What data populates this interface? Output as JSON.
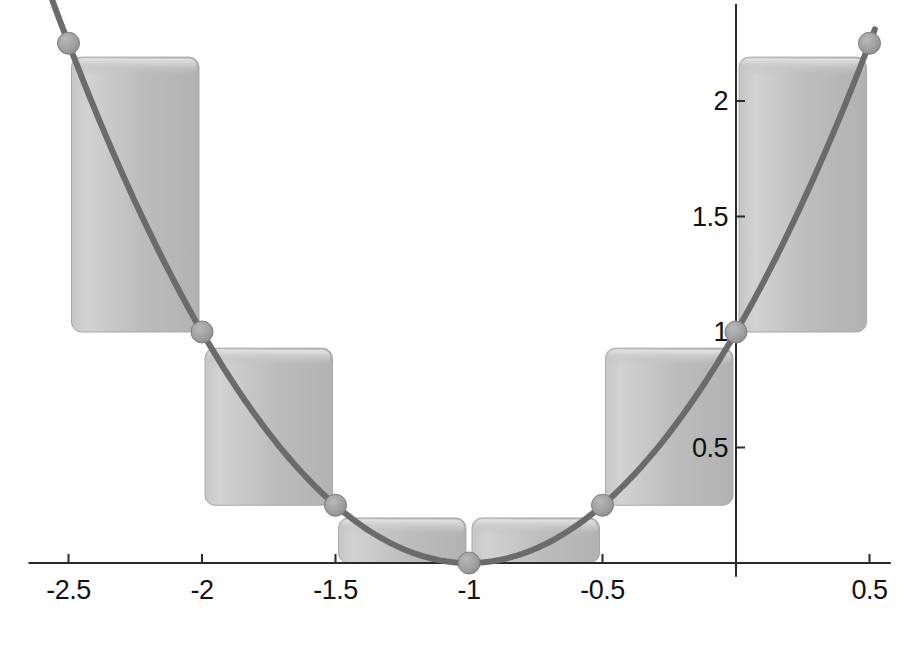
{
  "chart_data": {
    "type": "bar",
    "title": "",
    "subtitle": "",
    "xlabel": "",
    "ylabel": "",
    "xlim": [
      -2.65,
      0.58
    ],
    "ylim": [
      -0.06,
      2.42
    ],
    "grid": false,
    "legend": null,
    "x_ticks": [
      {
        "value": -2.5,
        "label": "-2.5"
      },
      {
        "value": -2,
        "label": "-2"
      },
      {
        "value": -1.5,
        "label": "-1.5"
      },
      {
        "value": -1,
        "label": "-1"
      },
      {
        "value": -0.5,
        "label": "-0.5"
      },
      {
        "value": 0.5,
        "label": "0.5"
      }
    ],
    "y_ticks": [
      {
        "value": 0.5,
        "label": "0.5"
      },
      {
        "value": 1,
        "label": "1"
      },
      {
        "value": 1.5,
        "label": "1.5"
      },
      {
        "value": 2,
        "label": "2"
      }
    ],
    "curve": {
      "name": "f(x) = (x+1)^2",
      "color": "#6b6b6b",
      "width": 6,
      "x_start": -2.56,
      "x_end": 0.52,
      "samples": 200
    },
    "markers": {
      "name": "partition endpoints",
      "color": "#9a9a9a",
      "edge_color": "#7d7d7d",
      "radius": 11,
      "x": [
        -2.5,
        -2,
        -1.5,
        -1,
        -0.5,
        0,
        0.5
      ],
      "y": [
        2.25,
        1,
        0.25,
        0,
        0.25,
        1,
        2.25
      ]
    },
    "bars": {
      "name": "Riemann rectangles",
      "fill": "#bdbdbd",
      "edge": "#a8a8a8",
      "highlight": "#d6d6d6",
      "corner_radius": 10,
      "intervals": [
        {
          "x0": -2.5,
          "x1": -2.0,
          "y_bottom": 1.0,
          "y_top": 2.19
        },
        {
          "x0": -2.0,
          "x1": -1.5,
          "y_bottom": 0.25,
          "y_top": 0.93
        },
        {
          "x0": -1.5,
          "x1": -1.0,
          "y_bottom": 0.0,
          "y_top": 0.195
        },
        {
          "x0": -1.0,
          "x1": -0.5,
          "y_bottom": 0.0,
          "y_top": 0.195
        },
        {
          "x0": -0.5,
          "x1": 0.0,
          "y_bottom": 0.25,
          "y_top": 0.93
        },
        {
          "x0": 0.0,
          "x1": 0.5,
          "y_bottom": 1.0,
          "y_top": 2.19
        }
      ]
    },
    "axes": {
      "color": "#2a2a2a",
      "width": 2,
      "x_axis_at_y": 0,
      "y_axis_at_x": 0,
      "tick_length": 9
    }
  }
}
